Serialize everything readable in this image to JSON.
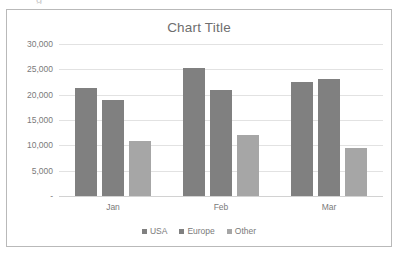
{
  "artifact": {
    "glyph": "g"
  },
  "chart_data": {
    "type": "bar",
    "title": "Chart Title",
    "xlabel": "",
    "ylabel": "",
    "categories": [
      "Jan",
      "Feb",
      "Mar"
    ],
    "series": [
      {
        "name": "USA",
        "values": [
          21300,
          25200,
          22500
        ],
        "color": "#808080"
      },
      {
        "name": "Europe",
        "values": [
          19000,
          21000,
          23100
        ],
        "color": "#808080"
      },
      {
        "name": "Other",
        "values": [
          10800,
          12000,
          9400
        ],
        "color": "#a6a6a6"
      }
    ],
    "ylim": [
      0,
      30000
    ],
    "ytick_values": [
      30000,
      25000,
      20000,
      15000,
      10000,
      5000,
      0
    ],
    "ytick_labels": [
      "30,000",
      "25,000",
      "20,000",
      "15,000",
      "10,000",
      "5,000",
      "-"
    ],
    "grid": true,
    "legend_position": "bottom",
    "plot_background": "#ffffff",
    "gridline_color": "#e2e2e2",
    "border_color": "#b9b9b9",
    "text_color": "#7a7a7a",
    "title_color": "#6e6e6e"
  }
}
